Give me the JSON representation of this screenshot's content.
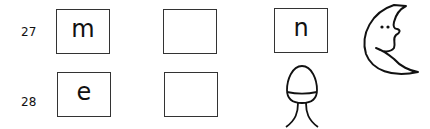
{
  "rows": [
    {
      "number": "27",
      "boxes": [
        "m",
        "",
        "n"
      ],
      "picture": "moon-icon"
    },
    {
      "number": "28",
      "boxes": [
        "e",
        ""
      ],
      "picture": "egg-icon"
    }
  ]
}
